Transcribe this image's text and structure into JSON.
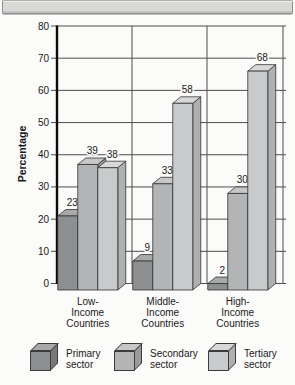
{
  "chart_data": {
    "type": "bar",
    "title": "",
    "xlabel": "",
    "ylabel": "Percentage",
    "ylim": [
      0,
      80
    ],
    "ytick_step": 10,
    "yticks": [
      0,
      10,
      20,
      30,
      40,
      50,
      60,
      70,
      80
    ],
    "grid": true,
    "style": "3d-bars",
    "legend_position": "bottom",
    "value_labels": true,
    "categories": [
      "Low-Income Countries",
      "Middle-Income Countries",
      "High-Income Countries"
    ],
    "category_label_lines": [
      [
        "Low-",
        "Income",
        "Countries"
      ],
      [
        "Middle-",
        "Income",
        "Countries"
      ],
      [
        "High-",
        "Income",
        "Countries"
      ]
    ],
    "series": [
      {
        "name": "Primary sector",
        "label_lines": [
          "Primary",
          "sector"
        ],
        "values": [
          23,
          9,
          2
        ],
        "color_front": "#8d8f90",
        "color_top": "#a7a9aa",
        "color_side": "#77797a"
      },
      {
        "name": "Secondary sector",
        "label_lines": [
          "Secondary",
          "sector"
        ],
        "values": [
          39,
          33,
          30
        ],
        "color_front": "#b2b4b5",
        "color_top": "#c5c7c8",
        "color_side": "#989a9b"
      },
      {
        "name": "Tertiary sector",
        "label_lines": [
          "Tertiary",
          "sector"
        ],
        "values": [
          38,
          58,
          68
        ],
        "color_front": "#c8cacb",
        "color_top": "#d7d8d9",
        "color_side": "#aeb0b1"
      }
    ]
  }
}
